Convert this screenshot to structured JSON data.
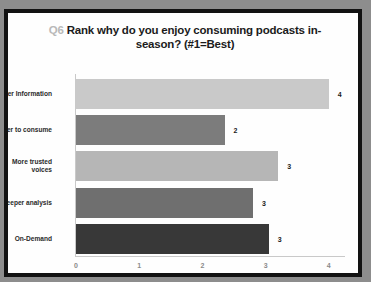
{
  "slide": {
    "title_prefix": "Q6",
    "title_text": " Rank why do you enjoy consuming podcasts in-season? (#1=Best)",
    "title_full": "Q6 Rank why do you enjoy consuming podcasts in-season? (#1=Best)"
  },
  "chart_data": {
    "type": "bar",
    "orientation": "horizontal",
    "title": "Q6 Rank why do you enjoy consuming podcasts in-season? (#1=Best)",
    "categories": [
      "Better Information",
      "Faster to consume",
      "More trusted voices",
      "Deeper analysis",
      "On-Demand"
    ],
    "values": [
      4.0,
      2.35,
      3.2,
      2.8,
      3.05
    ],
    "labels": [
      "4",
      "2",
      "3",
      "3",
      "3"
    ],
    "bar_colors": [
      "#c9c9c9",
      "#7c7c7c",
      "#b6b6b6",
      "#6f6f6f",
      "#383838"
    ],
    "xlabel": "",
    "ylabel": "",
    "xlim": [
      0,
      4.3
    ],
    "xticks": [
      0,
      1,
      2,
      3,
      4
    ],
    "xtick_labels": [
      "0",
      "1",
      "2",
      "3",
      "4"
    ],
    "grid": false,
    "legend": false
  }
}
